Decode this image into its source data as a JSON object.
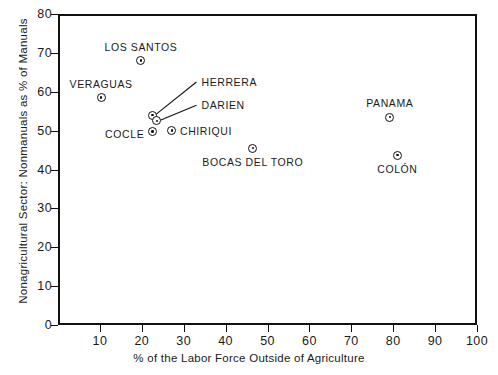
{
  "chart_data": {
    "type": "scatter",
    "title": "",
    "xlabel": "% of the Labor Force Outside of Agriculture",
    "ylabel": "Nonagricultural Sector: Nonmanuals as % of Manuals",
    "xlim": [
      0,
      100
    ],
    "ylim": [
      0,
      80
    ],
    "xticks": [
      10,
      20,
      30,
      40,
      50,
      60,
      70,
      80,
      90,
      100
    ],
    "yticks": [
      0,
      10,
      20,
      30,
      40,
      50,
      60,
      70,
      80
    ],
    "grid": false,
    "legend": "none",
    "marker_style": "circle-with-center-dot",
    "points": [
      {
        "label": "LOS SANTOS",
        "x": 19.8,
        "y": 68.0,
        "label_pos": "above"
      },
      {
        "label": "VERAGUAS",
        "x": 10.3,
        "y": 58.5,
        "label_pos": "above"
      },
      {
        "label": "HERRERA",
        "x": 22.5,
        "y": 54.0,
        "label_pos": "leader"
      },
      {
        "label": "DARIEN",
        "x": 23.6,
        "y": 52.5,
        "label_pos": "leader"
      },
      {
        "label": "COCLE",
        "x": 22.5,
        "y": 49.7,
        "label_pos": "left"
      },
      {
        "label": "CHIRIQUI",
        "x": 27.2,
        "y": 50.0,
        "label_pos": "right"
      },
      {
        "label": "BOCAS DEL TORO",
        "x": 46.5,
        "y": 45.5,
        "label_pos": "below"
      },
      {
        "label": "PANAMA",
        "x": 79.2,
        "y": 53.5,
        "label_pos": "above"
      },
      {
        "label": "COLON",
        "x": 81.0,
        "y": 43.7,
        "label_pos": "below"
      }
    ],
    "leader_labels": [
      {
        "label": "HERRERA",
        "text_x": 34.0,
        "text_y": 62.5
      },
      {
        "label": "DARIEN",
        "text_x": 34.0,
        "text_y": 56.5
      }
    ]
  },
  "labels": {
    "los_santos": "LOS  SANTOS",
    "veraguas": "VERAGUAS",
    "herrera": "HERRERA",
    "darien": "DARIEN",
    "cocle": "COCLE",
    "chiriqui": "CHIRIQUI",
    "bocas_del_toro": "BOCAS  DEL  TORO",
    "panama": "PANAMA",
    "colon": "COLÓN"
  },
  "axis": {
    "x_title": "% of the Labor Force Outside of Agriculture",
    "y_title": "Nonagricultural Sector: Nonmanuals as % of Manuals",
    "x_tick_labels": [
      "10",
      "20",
      "30",
      "40",
      "50",
      "60",
      "70",
      "80",
      "90",
      "100"
    ],
    "y_tick_labels": [
      "0",
      "10",
      "20",
      "30",
      "40",
      "50",
      "60",
      "70",
      "80"
    ]
  }
}
